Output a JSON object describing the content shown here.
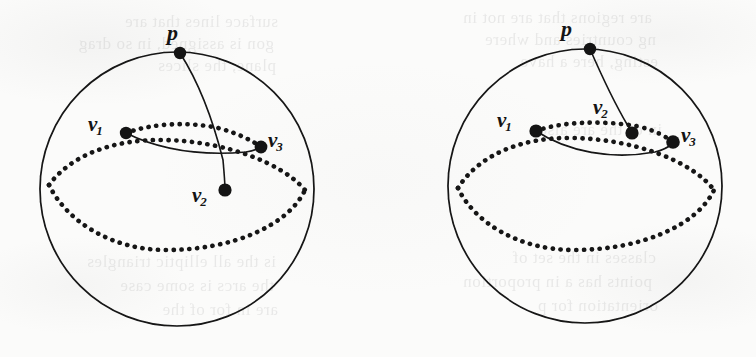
{
  "figure": {
    "background_color": "#fbfbfa",
    "ink_color": "#141414",
    "panel_count": 2,
    "labels": {
      "p": "p",
      "v": "v",
      "sub1": "1",
      "sub2": "2",
      "sub3": "3"
    },
    "panels": [
      {
        "name": "left-sphere",
        "circle": {
          "cx": 177,
          "cy": 189,
          "r": 137
        },
        "points": [
          {
            "id": "p",
            "label": "p",
            "x": 180,
            "y": 53,
            "label_x": 167,
            "label_y": 22
          },
          {
            "id": "v1",
            "label": "v1",
            "x": 126,
            "y": 133,
            "label_x": 88,
            "label_y": 114
          },
          {
            "id": "v2",
            "label": "v2",
            "x": 225,
            "y": 190,
            "label_x": 192,
            "label_y": 185
          },
          {
            "id": "v3",
            "label": "v3",
            "x": 261,
            "y": 147,
            "label_x": 268,
            "label_y": 130
          }
        ]
      },
      {
        "name": "right-sphere",
        "circle": {
          "cx": 585,
          "cy": 186,
          "r": 137
        },
        "points": [
          {
            "id": "p",
            "label": "p",
            "x": 590,
            "y": 49,
            "label_x": 561,
            "label_y": 18
          },
          {
            "id": "v1",
            "label": "v1",
            "x": 536,
            "y": 131,
            "label_x": 497,
            "label_y": 110
          },
          {
            "id": "v2",
            "label": "v2",
            "x": 632,
            "y": 133,
            "label_x": 593,
            "label_y": 97
          },
          {
            "id": "v3",
            "label": "v3",
            "x": 673,
            "y": 142,
            "label_x": 681,
            "label_y": 125
          }
        ]
      }
    ],
    "bleed_text": [
      {
        "text": "surface lines that are",
        "x": 18,
        "y": 12
      },
      {
        "text": "gon is assigned, in so drag",
        "x": 14,
        "y": 34
      },
      {
        "text": "plane, the slices",
        "x": 16,
        "y": 56
      },
      {
        "text": "are regions that are not in",
        "x": 392,
        "y": 8
      },
      {
        "text": "ng countries and where",
        "x": 396,
        "y": 30
      },
      {
        "text": "esting, here a  have",
        "x": 398,
        "y": 52
      },
      {
        "text": "in of the are also",
        "x": 402,
        "y": 120
      },
      {
        "text": "is the all elliptic triangles",
        "x": 16,
        "y": 252
      },
      {
        "text": "the arcs is  some case",
        "x": 14,
        "y": 276
      },
      {
        "text": "are in  for  of the",
        "x": 18,
        "y": 300
      },
      {
        "text": "classes in the set of",
        "x": 396,
        "y": 248
      },
      {
        "text": "points has a in proportion",
        "x": 392,
        "y": 272
      },
      {
        "text": "orientation  for p",
        "x": 398,
        "y": 296
      }
    ]
  }
}
